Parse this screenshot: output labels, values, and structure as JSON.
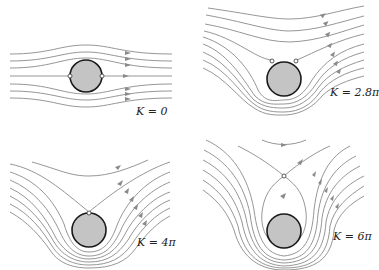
{
  "figure": {
    "panels": [
      {
        "id": "k0",
        "label": "K = 0",
        "stagnation_points": 2,
        "position": "top-left"
      },
      {
        "id": "k2_8pi",
        "label": "K = 2.8π",
        "stagnation_points": 2,
        "position": "top-right"
      },
      {
        "id": "k4pi",
        "label": "K = 4π",
        "stagnation_points": 1,
        "position": "bottom-left"
      },
      {
        "id": "k6pi",
        "label": "K = 6π",
        "stagnation_points": 1,
        "position": "bottom-right",
        "note": "stagnation point detached from cylinder surface"
      }
    ]
  },
  "colors": {
    "streamline": "#8a8a8a",
    "cylinder_fill": "#c4c4c4",
    "cylinder_outline": "#1a1a1a",
    "background": "#ffffff"
  }
}
